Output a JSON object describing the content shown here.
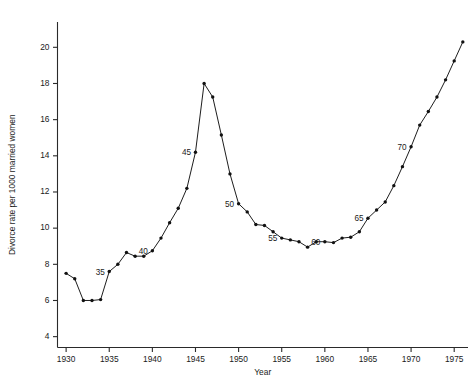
{
  "chart_data": {
    "type": "line",
    "title": "",
    "xlabel": "Year",
    "ylabel": "Divorce rate per 1000 married women",
    "xlim": [
      1929.0,
      1976.6
    ],
    "ylim": [
      3.4,
      21.4
    ],
    "grid": false,
    "legend": null,
    "xticks": [
      1930,
      1935,
      1940,
      1945,
      1950,
      1955,
      1960,
      1965,
      1970,
      1975
    ],
    "xtick_labels": [
      "1930",
      "1935",
      "1940",
      "1945",
      "1950",
      "1955",
      "1960",
      "1965",
      "1970",
      "1975"
    ],
    "yticks": [
      4,
      6,
      8,
      10,
      12,
      14,
      16,
      18,
      20
    ],
    "ytick_labels": [
      "4",
      "6",
      "8",
      "10",
      "12",
      "14",
      "16",
      "18",
      "20"
    ],
    "x": [
      1930,
      1931,
      1932,
      1933,
      1934,
      1935,
      1936,
      1937,
      1938,
      1939,
      1940,
      1941,
      1942,
      1943,
      1944,
      1945,
      1946,
      1947,
      1948,
      1949,
      1950,
      1951,
      1952,
      1953,
      1954,
      1955,
      1956,
      1957,
      1958,
      1959,
      1960,
      1961,
      1962,
      1963,
      1964,
      1965,
      1966,
      1967,
      1968,
      1969,
      1970,
      1971,
      1972,
      1973,
      1974,
      1975,
      1976
    ],
    "values": [
      7.5,
      7.2,
      6.0,
      6.0,
      6.05,
      7.6,
      8.0,
      8.65,
      8.45,
      8.45,
      8.75,
      9.45,
      10.3,
      11.1,
      12.2,
      14.2,
      18.0,
      17.25,
      15.15,
      13.0,
      11.35,
      10.9,
      10.2,
      10.15,
      9.8,
      9.45,
      9.35,
      9.25,
      8.95,
      9.25,
      9.25,
      9.2,
      9.45,
      9.5,
      9.8,
      10.55,
      11.0,
      11.45,
      12.35,
      13.4,
      14.5,
      15.7,
      16.45,
      17.25,
      18.2,
      19.25,
      20.3
    ],
    "annotations": [
      {
        "text": "35",
        "x": 1935,
        "y": 7.6
      },
      {
        "text": "40",
        "x": 1940,
        "y": 8.75
      },
      {
        "text": "45",
        "x": 1945,
        "y": 14.2
      },
      {
        "text": "50",
        "x": 1950,
        "y": 11.35
      },
      {
        "text": "55",
        "x": 1955,
        "y": 9.45
      },
      {
        "text": "60",
        "x": 1960,
        "y": 9.25
      },
      {
        "text": "65",
        "x": 1965,
        "y": 10.55
      },
      {
        "text": "70",
        "x": 1970,
        "y": 14.5
      }
    ],
    "colors": {
      "line": "#111111",
      "marker": "#111111",
      "axis": "#2a2a2a",
      "background": "#ffffff",
      "text": "#1a1a1a"
    }
  }
}
